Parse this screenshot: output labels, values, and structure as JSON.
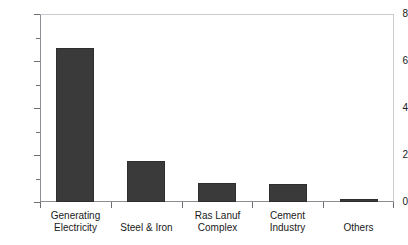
{
  "chart_data": {
    "type": "bar",
    "title": "",
    "xlabel": "",
    "ylabel": "Million cm/d",
    "ylim": [
      0,
      8
    ],
    "ytick_values": [
      0,
      2,
      4,
      6,
      8
    ],
    "ytick_labels": [
      "0",
      "2",
      "4",
      "6",
      "8"
    ],
    "yminor_values": [
      1,
      3,
      5,
      7
    ],
    "grid": false,
    "legend": null,
    "bar_color": "#3a3a3a",
    "axis_color": "#8d8d93",
    "categories": [
      "Generating Electricity",
      "Steel & Iron",
      "Ras Lanuf Complex",
      "Cement Industry",
      "Others"
    ],
    "category_label_lines": [
      [
        "Generating",
        "Electricity"
      ],
      [
        "Steel & Iron"
      ],
      [
        "Ras Lanuf",
        "Complex"
      ],
      [
        "Cement",
        "Industry"
      ],
      [
        "Others"
      ]
    ],
    "values": [
      6.55,
      1.74,
      0.81,
      0.77,
      0.13
    ]
  },
  "axis": {
    "y_label": "Million cm/d"
  },
  "ticks": {
    "y": [
      {
        "value": 8,
        "label": "8"
      },
      {
        "value": 6,
        "label": "6"
      },
      {
        "value": 4,
        "label": "4"
      },
      {
        "value": 2,
        "label": "2"
      },
      {
        "value": 0,
        "label": "0"
      }
    ]
  },
  "title_strip": ""
}
